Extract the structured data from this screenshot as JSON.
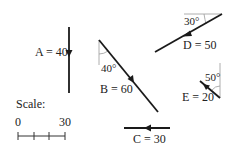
{
  "vectors": [
    {
      "id": "A",
      "label": "A = 40",
      "magnitude": 40,
      "direction": "down"
    },
    {
      "id": "B",
      "label": "B = 60",
      "magnitude": 60,
      "angle_label": "40°",
      "reference": "vertical"
    },
    {
      "id": "C",
      "label": "C = 30",
      "magnitude": 30,
      "direction": "left"
    },
    {
      "id": "D",
      "label": "D = 50",
      "magnitude": 50,
      "angle_label": "30°",
      "reference": "horizontal"
    },
    {
      "id": "E",
      "label": "E = 20",
      "magnitude": 20,
      "angle_label": "50°",
      "reference": "vertical"
    }
  ],
  "scale": {
    "title": "Scale:",
    "start": "0",
    "end": "30"
  }
}
